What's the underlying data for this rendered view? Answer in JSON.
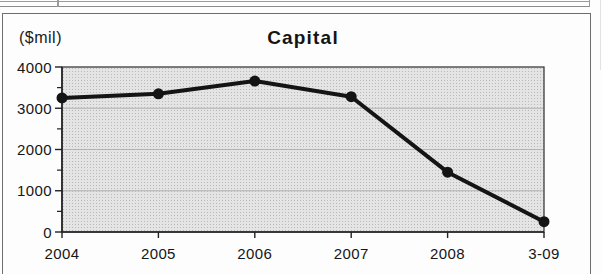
{
  "chart_data": {
    "type": "line",
    "title": "Capital",
    "ylabel": "($mil)",
    "categories": [
      "2004",
      "2005",
      "2006",
      "2007",
      "2008",
      "3-09"
    ],
    "series": [
      {
        "name": "Capital",
        "values": [
          3250,
          3350,
          3660,
          3280,
          1450,
          250
        ]
      }
    ],
    "ylim": [
      0,
      4000
    ],
    "yticks": [
      0,
      1000,
      2000,
      3000,
      4000
    ],
    "ytick_labels": [
      "0",
      "1000",
      "2000",
      "3000",
      "4000"
    ],
    "minor_tick_step": 500,
    "grid": "horizontal-major",
    "legend": "none",
    "marker": "filled-circle",
    "colors": {
      "line": "#141414",
      "marker": "#141414",
      "plot_bg": "#e4e4e4",
      "grid": "#b2b2b2",
      "axis": "#222222",
      "plot_border": "#3d3d3d",
      "frame": "#6e6e6e",
      "text": "#161616"
    }
  }
}
